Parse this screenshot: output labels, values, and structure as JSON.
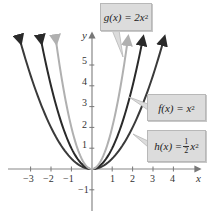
{
  "chart_data": {
    "type": "line",
    "title": "",
    "xlabel": "x",
    "ylabel": "y",
    "xlim": [
      -3.5,
      4.9
    ],
    "ylim": [
      -1.8,
      6.5
    ],
    "x_ticks": [
      -3,
      -2,
      -1,
      1,
      2,
      3,
      4
    ],
    "y_ticks": [
      -1,
      1,
      2,
      3,
      4,
      5
    ],
    "grid": false,
    "series": [
      {
        "name": "g(x) = 2x^2",
        "formula": "2*x^2",
        "coef": 2,
        "color": "#b0b0b0",
        "label_text": "g(x) = 2x",
        "label_sup": "2"
      },
      {
        "name": "f(x) = x^2",
        "formula": "x^2",
        "coef": 1,
        "color": "#2a2a2a",
        "label_text": "f(x) = x",
        "label_sup": "2"
      },
      {
        "name": "h(x) = 1/2 x^2",
        "formula": "0.5*x^2",
        "coef": 0.5,
        "color": "#3a3a3a",
        "label_text": "h(x) = ",
        "label_num": "1",
        "label_den": "2",
        "label_tail": "x",
        "label_sup": "2"
      }
    ]
  },
  "labels": {
    "x_axis": "x",
    "y_axis": "y",
    "g": {
      "prefix": "g(x) = 2x",
      "sup": "2"
    },
    "f": {
      "prefix": "f(x) = x",
      "sup": "2"
    },
    "h": {
      "prefix": "h(x) = ",
      "num": "1",
      "den": "2",
      "var": "x",
      "sup": "2"
    }
  },
  "ticks": {
    "x": [
      "−3",
      "−2",
      "−1",
      "1",
      "2",
      "3",
      "4"
    ],
    "y": [
      "5",
      "4",
      "3",
      "2",
      "1",
      "−1"
    ]
  }
}
